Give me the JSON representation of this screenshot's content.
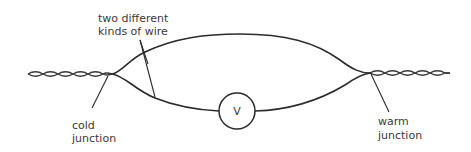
{
  "diagram": {
    "labels": {
      "wires_line1": "two different",
      "wires_line2": "kinds of wire",
      "cold_line1": "cold",
      "cold_line2": "junction",
      "warm_line1": "warm",
      "warm_line2": "junction",
      "meter": "V"
    },
    "components": [
      {
        "id": "cold-junction",
        "name": "cold junction"
      },
      {
        "id": "warm-junction",
        "name": "warm junction"
      },
      {
        "id": "upper-wire",
        "name": "wire type 1"
      },
      {
        "id": "lower-wire",
        "name": "wire type 2"
      },
      {
        "id": "voltmeter",
        "name": "voltmeter",
        "symbol": "V"
      }
    ],
    "colors": {
      "stroke": "#2b2b2b",
      "text": "#3a3a3a",
      "background": "#ffffff"
    }
  }
}
